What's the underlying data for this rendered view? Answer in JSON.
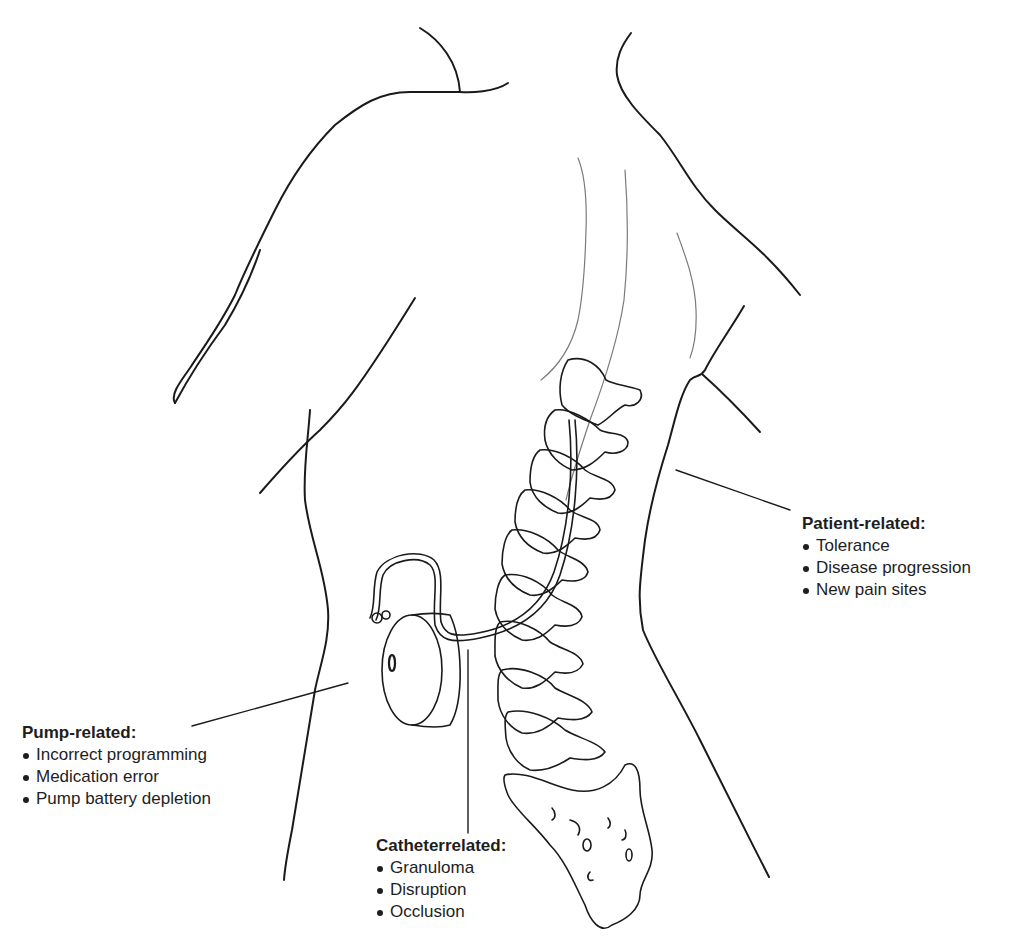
{
  "figure": {
    "colors": {
      "outline": "#1a1a1a",
      "thin_contour": "#7a7a7a",
      "background": "#ffffff"
    }
  },
  "labels": {
    "patient": {
      "title": "Patient-related:",
      "items": [
        "Tolerance",
        "Disease progression",
        "New pain sites"
      ]
    },
    "pump": {
      "title": "Pump-related:",
      "items": [
        "Incorrect programming",
        "Medication error",
        "Pump battery depletion"
      ]
    },
    "catheter": {
      "title": "Catheterrelated:",
      "items": [
        "Granuloma",
        "Disruption",
        "Occlusion"
      ]
    }
  }
}
